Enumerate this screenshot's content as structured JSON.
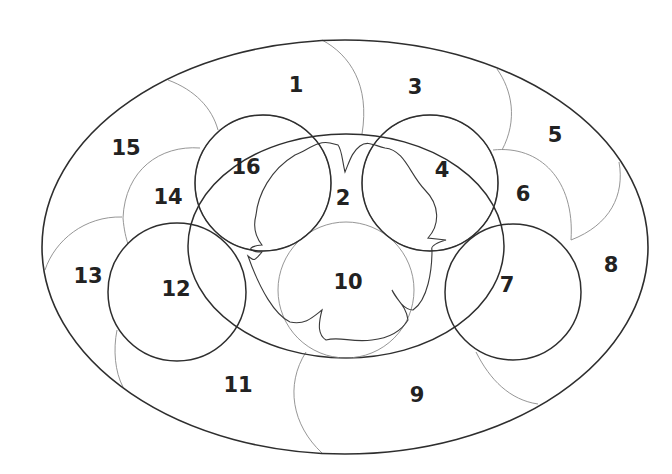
{
  "diagram": {
    "type": "numbered-region-map",
    "stroke_color": "#2e2e2e",
    "thin_stroke_color": "#8a8a8a",
    "background": "#ffffff",
    "regions": [
      {
        "id": "1",
        "label": "1",
        "x": 296,
        "y": 85
      },
      {
        "id": "2",
        "label": "2",
        "x": 343,
        "y": 198
      },
      {
        "id": "3",
        "label": "3",
        "x": 415,
        "y": 87
      },
      {
        "id": "4",
        "label": "4",
        "x": 442,
        "y": 170
      },
      {
        "id": "5",
        "label": "5",
        "x": 555,
        "y": 135
      },
      {
        "id": "6",
        "label": "6",
        "x": 523,
        "y": 194
      },
      {
        "id": "7",
        "label": "7",
        "x": 507,
        "y": 285
      },
      {
        "id": "8",
        "label": "8",
        "x": 611,
        "y": 265
      },
      {
        "id": "9",
        "label": "9",
        "x": 417,
        "y": 395
      },
      {
        "id": "10",
        "label": "10",
        "x": 348,
        "y": 282
      },
      {
        "id": "11",
        "label": "11",
        "x": 238,
        "y": 385
      },
      {
        "id": "12",
        "label": "12",
        "x": 176,
        "y": 289
      },
      {
        "id": "13",
        "label": "13",
        "x": 88,
        "y": 276
      },
      {
        "id": "14",
        "label": "14",
        "x": 168,
        "y": 197
      },
      {
        "id": "15",
        "label": "15",
        "x": 126,
        "y": 148
      },
      {
        "id": "16",
        "label": "16",
        "x": 246,
        "y": 167
      }
    ]
  }
}
